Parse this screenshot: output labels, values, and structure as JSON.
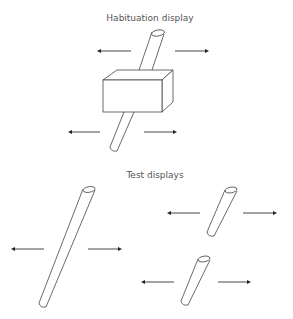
{
  "sections": {
    "habituation": {
      "title": "Habituation display",
      "object": "rod-occluded-by-box",
      "arrows": "left-right motion"
    },
    "test": {
      "title": "Test displays",
      "displays": [
        {
          "name": "complete-rod",
          "arrows": "left-right motion"
        },
        {
          "name": "broken-rod-top",
          "arrows": "left-right motion"
        },
        {
          "name": "broken-rod-bottom",
          "arrows": "left-right motion"
        }
      ]
    }
  },
  "colors": {
    "stroke": "#444444",
    "text": "#555555",
    "background": "#ffffff"
  }
}
